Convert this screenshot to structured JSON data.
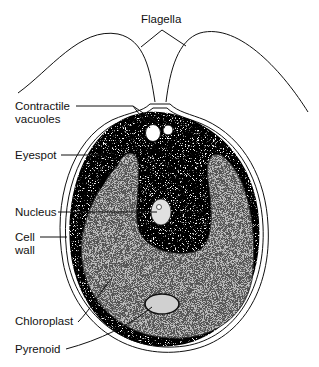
{
  "diagram": {
    "labels": {
      "flagella": "Flagella",
      "contractile_vacuoles_line1": "Contractile",
      "contractile_vacuoles_line2": "vacuoles",
      "eyespot": "Eyespot",
      "nucleus": "Nucleus",
      "cell_wall_line1": "Cell",
      "cell_wall_line2": "wall",
      "chloroplast": "Chloroplast",
      "pyrenoid": "Pyrenoid"
    },
    "colors": {
      "line": "#111111",
      "background": "#ffffff",
      "eyespot": "#000000"
    }
  }
}
